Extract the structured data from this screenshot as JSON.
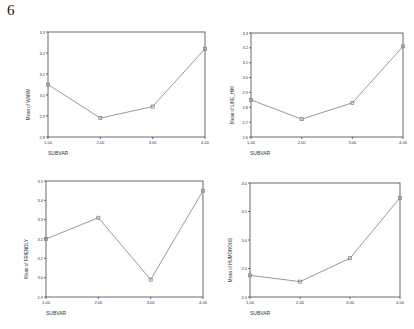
{
  "page": {
    "number": "6"
  },
  "chart_data": [
    {
      "type": "line",
      "title": "",
      "xlabel": "SUBVAR",
      "ylabel": "Mean of WARM",
      "x": [
        1,
        2,
        3,
        4
      ],
      "x_tick_labels": [
        "1.00",
        "2.00",
        "3.00",
        "4.00"
      ],
      "values": [
        3.05,
        2.89,
        2.945,
        3.22
      ],
      "ylim": [
        2.8,
        3.3
      ],
      "y_tick_labels": [
        "2.8",
        "2.9",
        "3.0",
        "3.1",
        "3.2",
        "3.3"
      ],
      "grid": false,
      "legend": null
    },
    {
      "type": "line",
      "title": "",
      "xlabel": "SUBVAR",
      "ylabel": "Mean of LIKE_HIM",
      "x": [
        1,
        2,
        3,
        4
      ],
      "x_tick_labels": [
        "1.00",
        "2.00",
        "3.00",
        "4.00"
      ],
      "values": [
        2.85,
        2.72,
        2.83,
        3.21
      ],
      "ylim": [
        2.6,
        3.3
      ],
      "y_tick_labels": [
        "2.6",
        "2.7",
        "2.8",
        "2.9",
        "3.0",
        "3.1",
        "3.2",
        "3.3"
      ],
      "grid": false,
      "legend": null
    },
    {
      "type": "line",
      "title": "",
      "xlabel": "SUBVAR",
      "ylabel": "Mean of FRIENDLY",
      "x": [
        1,
        2,
        3,
        4
      ],
      "x_tick_labels": [
        "1.00",
        "2.00",
        "3.00",
        "4.00"
      ],
      "values": [
        3.2,
        3.31,
        2.99,
        3.45
      ],
      "ylim": [
        2.9,
        3.5
      ],
      "y_tick_labels": [
        "2.9",
        "3.0",
        "3.1",
        "3.2",
        "3.3",
        "3.4",
        "3.5"
      ],
      "grid": false,
      "legend": null
    },
    {
      "type": "line",
      "title": "",
      "xlabel": "SUBVAR",
      "ylabel": "Mean of HUMOROUS",
      "x": [
        1,
        2,
        3,
        4
      ],
      "x_tick_labels": [
        "1.00",
        "2.00",
        "3.00",
        "4.00"
      ],
      "values": [
        2.38,
        2.27,
        2.68,
        3.74
      ],
      "ylim": [
        2.0,
        4.0
      ],
      "y_tick_labels": [
        "2.0",
        "2.5",
        "3.0",
        "3.5",
        "4.0"
      ],
      "grid": false,
      "legend": null
    }
  ],
  "layout": [
    {
      "left": 48,
      "top": 32,
      "width": 157,
      "height": 105,
      "ylabel_x": 30,
      "xlabel_x": 48
    },
    {
      "left": 251,
      "top": 33,
      "width": 152,
      "height": 104,
      "ylabel_x": 234,
      "xlabel_x": 250
    },
    {
      "left": 46,
      "top": 181,
      "width": 157,
      "height": 116,
      "ylabel_x": 28,
      "xlabel_x": 46
    },
    {
      "left": 250,
      "top": 183,
      "width": 150,
      "height": 114,
      "ylabel_x": 232,
      "xlabel_x": 250
    }
  ],
  "colors": {
    "line": "#9a9a9a",
    "axis": "#444444",
    "text": "#333333",
    "marker": "#777777"
  }
}
